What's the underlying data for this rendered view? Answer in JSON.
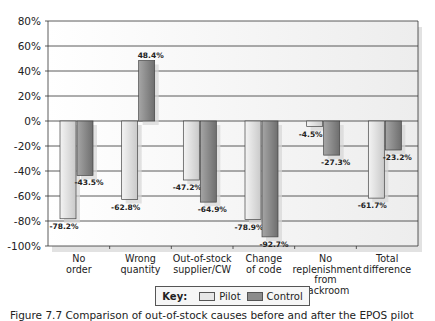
{
  "chart_data": {
    "type": "bar",
    "title": "",
    "xlabel": "",
    "ylabel": "",
    "ylim": [
      -100,
      80
    ],
    "yticks": [
      "80%",
      "60%",
      "40%",
      "20%",
      "0%",
      "-20%",
      "-40%",
      "-60%",
      "-80%",
      "-100%"
    ],
    "grid": true,
    "categories": [
      [
        "No",
        "order"
      ],
      [
        "Wrong",
        "quantity"
      ],
      [
        "Out-of-stock",
        "supplier/CW"
      ],
      [
        "Change",
        "of code"
      ],
      [
        "No",
        "replenishment",
        "from backroom"
      ],
      [
        "Total",
        "difference"
      ]
    ],
    "series": [
      {
        "name": "Pilot",
        "color": "#dcdcdc",
        "values": [
          -78.2,
          -62.8,
          -47.2,
          -78.9,
          -4.5,
          -61.7
        ],
        "labels": [
          "-78.2%",
          "-62.8%",
          "-47.2%",
          "-78.9%",
          "-4.5%",
          "-61.7%"
        ]
      },
      {
        "name": "Control",
        "color": "#8c8c8c",
        "values": [
          -43.5,
          48.4,
          -64.9,
          -92.7,
          -27.3,
          -23.2
        ],
        "labels": [
          "-43.5%",
          "48.4%",
          "-64.9%",
          "-92.7%",
          "-27.3%",
          "-23.2%"
        ]
      }
    ],
    "legend_position": "bottom"
  },
  "legend": {
    "key_label": "Key:",
    "items": [
      "Pilot",
      "Control"
    ]
  },
  "caption": "Figure 7.7 Comparison of out-of-stock causes before and after the EPOS pilot"
}
